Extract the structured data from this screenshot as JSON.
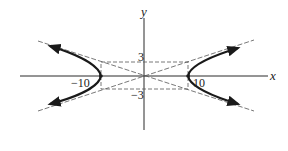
{
  "diagram": {
    "type": "hyperbola",
    "equation_implied": "x^2/100 - y^2/9 = 1",
    "axes": {
      "x_label": "x",
      "y_label": "y"
    },
    "tick_labels": {
      "x_neg": "−10",
      "x_pos": "10",
      "y_pos": "3",
      "y_neg": "−3"
    },
    "parameters": {
      "a": 10,
      "b": 3
    },
    "elements": [
      "x-axis",
      "y-axis",
      "fundamental-rectangle (dashed)",
      "two asymptotes (dashed)",
      "left branch with arrows",
      "right branch with arrows"
    ],
    "colors": {
      "curve": "#1a1a1a",
      "axis": "#2a2a2a",
      "dashed": "#555555",
      "background": "#ffffff"
    }
  }
}
